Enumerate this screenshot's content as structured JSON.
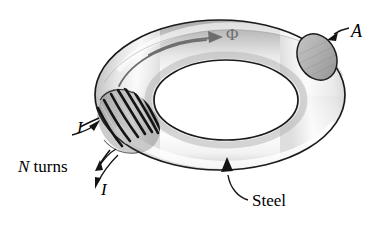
{
  "figure": {
    "name": "toroidal-steel-core-with-winding",
    "background_color": "#ffffff",
    "ink_color": "#000000",
    "core_gray_dark": "#8d8d8d",
    "core_gray_mid": "#b9b9b9",
    "core_highlight": "#ffffff",
    "flux_arrow_color": "#6e6e6e",
    "hole_color": "#ffffff"
  },
  "labels": {
    "area": "A",
    "flux": "Φ",
    "current_in": "I",
    "current_out": "I",
    "turns_symbol": "N",
    "turns_word": "turns",
    "material": "Steel"
  },
  "annotations": [
    {
      "id": "area-callout",
      "label": "A",
      "points_to": "torus-cross-section-ellipse",
      "leader": "short-straight-arrow"
    },
    {
      "id": "flux-callout",
      "label": "Φ",
      "points_to": "flux-direction-along-core",
      "leader": "long-curved-arrow-clockwise"
    },
    {
      "id": "current-in-callout",
      "label": "I",
      "points_to": "coil-winding-lead-upper",
      "leader": "curved-arrow-up-right"
    },
    {
      "id": "current-out-callout",
      "label": "I",
      "points_to": "coil-winding-lead-lower",
      "leader": "curved-arrow-down-left"
    },
    {
      "id": "turns-callout",
      "label": "N turns",
      "points_to": "coil-winding",
      "leader": "curved-arrow-up-right"
    },
    {
      "id": "material-callout",
      "label": "Steel",
      "points_to": "torus-body-lower",
      "leader": "curved-arrow-up-left"
    }
  ],
  "geometry": {
    "torus_center_x": 220,
    "torus_center_y": 95,
    "torus_outer_rx": 125,
    "torus_outer_ry": 75,
    "torus_hole_rx": 72,
    "torus_hole_ry": 40,
    "cross_section_cx": 317,
    "cross_section_cy": 56,
    "coil_center_x": 122,
    "coil_center_y": 123,
    "coil_turn_count": 9
  }
}
